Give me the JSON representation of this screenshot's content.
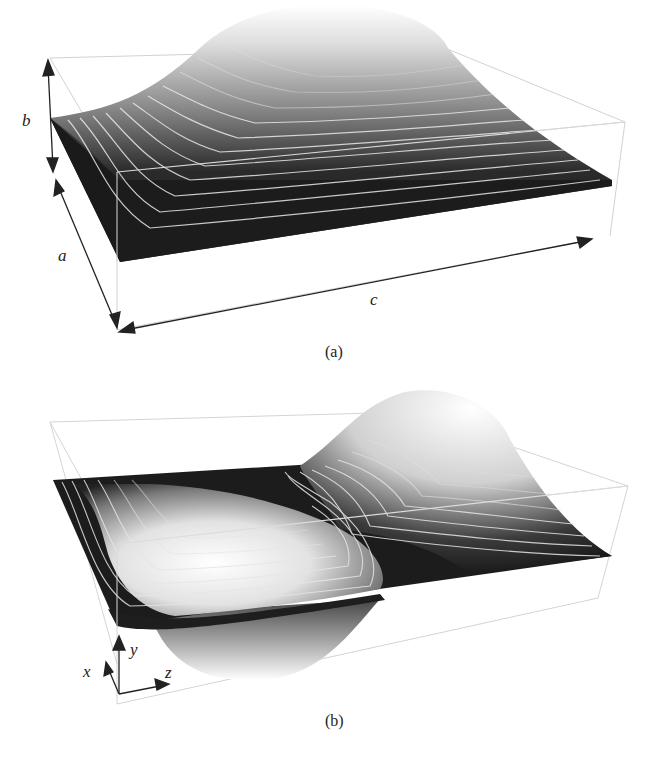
{
  "figure": {
    "panels": [
      {
        "id": "a",
        "caption": "(a)",
        "description": "3D surface of single-hump mode shape over rectangular cross-section with white contour lines",
        "dimension_labels": {
          "height": "b",
          "width": "a",
          "length": "c"
        }
      },
      {
        "id": "b",
        "caption": "(b)",
        "description": "3D surface of antisymmetric two-lobe mode shape (one trough, one peak) with white contour lines",
        "axis_labels": {
          "x": "x",
          "y": "y",
          "z": "z"
        }
      }
    ],
    "colors": {
      "surface_low": "#1a1a1a",
      "surface_high": "#ffffff",
      "contour": "#e6e6e6",
      "box_edge": "#cfcfcf",
      "arrow": "#222222"
    }
  }
}
